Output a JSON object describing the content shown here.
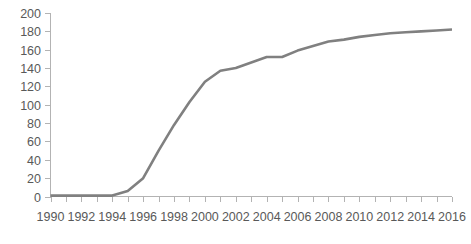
{
  "chart_data": {
    "type": "line",
    "title": "",
    "subtitle": "",
    "xlabel": "",
    "ylabel": "",
    "xlim": [
      1990,
      2016
    ],
    "ylim": [
      0,
      200
    ],
    "ytick_step": 20,
    "xtick_step": 2,
    "grid": false,
    "legend": false,
    "legend_position": "none",
    "markers": false,
    "line_color": "#808080",
    "axis_color": "#b3b3b3",
    "label_color": "#595959",
    "background": "#ffffff",
    "ytick_labels": [
      "0",
      "20",
      "40",
      "60",
      "80",
      "100",
      "120",
      "140",
      "160",
      "180",
      "200"
    ],
    "ytick_values": [
      0,
      20,
      40,
      60,
      80,
      100,
      120,
      140,
      160,
      180,
      200
    ],
    "xtick_labels": [
      "1990",
      "1992",
      "1994",
      "1996",
      "1998",
      "2000",
      "2002",
      "2004",
      "2006",
      "2008",
      "2010",
      "2012",
      "2014",
      "2016"
    ],
    "xtick_values": [
      1990,
      1992,
      1994,
      1996,
      1998,
      2000,
      2002,
      2004,
      2006,
      2008,
      2010,
      2012,
      2014,
      2016
    ],
    "x": [
      1990,
      1991,
      1992,
      1993,
      1994,
      1995,
      1996,
      1997,
      1998,
      1999,
      2000,
      2001,
      2002,
      2003,
      2004,
      2005,
      2006,
      2007,
      2008,
      2009,
      2010,
      2011,
      2012,
      2013,
      2014,
      2015,
      2016
    ],
    "series": [
      {
        "name": "Cumulative total",
        "color": "#808080",
        "values": [
          1,
          1,
          1,
          1,
          1,
          6,
          20,
          50,
          78,
          103,
          125,
          137,
          140,
          146,
          152,
          152,
          159,
          164,
          169,
          171,
          174,
          176,
          178,
          179,
          180,
          181,
          182
        ]
      }
    ]
  }
}
